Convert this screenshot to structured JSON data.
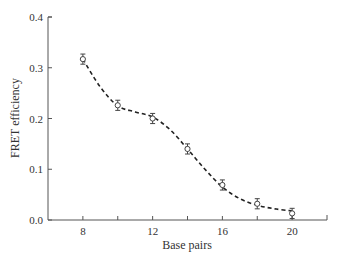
{
  "chart_data": {
    "type": "scatter",
    "title": "",
    "xlabel": "Base pairs",
    "ylabel": "FRET efficiency",
    "xlim": [
      6,
      22
    ],
    "ylim": [
      0,
      0.4
    ],
    "x_ticks": [
      8,
      10,
      12,
      14,
      16,
      18,
      20
    ],
    "x_tick_labels": [
      "8",
      "12",
      "16",
      "20"
    ],
    "y_ticks": [
      0.0,
      0.1,
      0.2,
      0.3,
      0.4
    ],
    "y_tick_labels": [
      "0.0",
      "0.1",
      "0.2",
      "0.3",
      "0.4"
    ],
    "grid": false,
    "legend": null,
    "series": [
      {
        "name": "Measured FRET efficiency",
        "marker": "open-circle-with-errorbar",
        "x": [
          8,
          10,
          12,
          14,
          16,
          18,
          20
        ],
        "y": [
          0.317,
          0.226,
          0.2,
          0.14,
          0.069,
          0.032,
          0.013
        ],
        "error": [
          0.01,
          0.01,
          0.01,
          0.01,
          0.01,
          0.01,
          0.01
        ]
      },
      {
        "name": "Fit curve",
        "style": "dashed",
        "x": [
          8,
          9,
          10,
          11,
          12,
          13,
          14,
          15,
          16,
          17,
          18,
          19,
          20
        ],
        "y": [
          0.317,
          0.262,
          0.225,
          0.213,
          0.203,
          0.178,
          0.14,
          0.1,
          0.065,
          0.042,
          0.029,
          0.022,
          0.018
        ]
      }
    ]
  },
  "labels": {
    "xlabel": "Base pairs",
    "ylabel": "FRET efficiency"
  }
}
